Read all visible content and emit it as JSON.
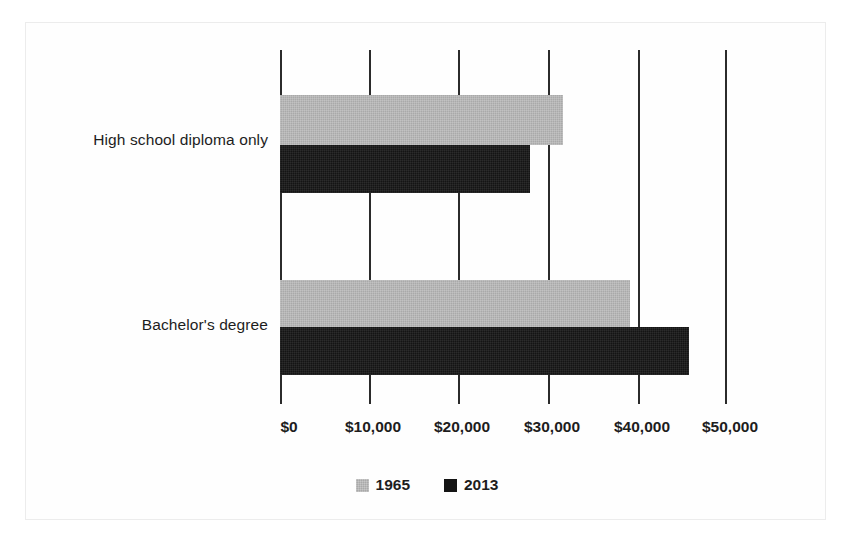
{
  "chart_data": {
    "type": "bar",
    "orientation": "horizontal",
    "title": "",
    "subtitle": "",
    "xlabel": "",
    "ylabel": "",
    "categories": [
      "High school diploma only",
      "Bachelor's degree"
    ],
    "series": [
      {
        "name": "1965",
        "color": "#a9a9a9",
        "values": [
          31600,
          39100
        ]
      },
      {
        "name": "2013",
        "color": "#141414",
        "values": [
          28000,
          45800
        ]
      }
    ],
    "xlim": [
      0,
      50000
    ],
    "xticks": [
      0,
      10000,
      20000,
      30000,
      40000,
      50000
    ],
    "xticklabels": [
      "$0",
      "$10,000",
      "$20,000",
      "$30,000",
      "$40,000",
      "$50,000"
    ],
    "grid": true,
    "grid_axis": "x",
    "legend": [
      "1965",
      "2013"
    ],
    "legend_position": "bottom-center"
  },
  "figure": {
    "background_color": "#ffffff",
    "frame_color": "#ececec",
    "gridline_color": "#2b2b2b",
    "text_color": "#1d1d1d"
  }
}
